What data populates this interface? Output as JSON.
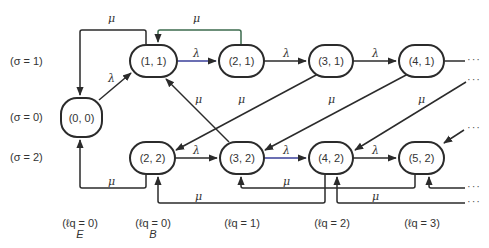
{
  "diagram": {
    "type": "state-transition",
    "row_labels": [
      {
        "id": "sigma1",
        "text": "(σ = 1)"
      },
      {
        "id": "sigma0",
        "text": "(σ = 0)"
      },
      {
        "id": "sigma2",
        "text": "(σ = 2)"
      }
    ],
    "column_labels": [
      {
        "text": "(ℓq = 0)",
        "sub": "E"
      },
      {
        "text": "(ℓq = 0)",
        "sub": "B"
      },
      {
        "text": "(ℓq = 1)",
        "sub": ""
      },
      {
        "text": "(ℓq = 2)",
        "sub": ""
      },
      {
        "text": "(ℓq = 3)",
        "sub": ""
      }
    ],
    "nodes": [
      {
        "id": "n00",
        "label": "(0, 0)"
      },
      {
        "id": "n11",
        "label": "(1, 1)"
      },
      {
        "id": "n21",
        "label": "(2, 1)"
      },
      {
        "id": "n31",
        "label": "(3, 1)"
      },
      {
        "id": "n41",
        "label": "(4, 1)"
      },
      {
        "id": "n22",
        "label": "(2, 2)"
      },
      {
        "id": "n32",
        "label": "(3, 2)"
      },
      {
        "id": "n42",
        "label": "(4, 2)"
      },
      {
        "id": "n52",
        "label": "(5, 2)"
      }
    ],
    "edges": [
      {
        "from": "(0, 0)",
        "to": "(1, 1)",
        "label": "λ"
      },
      {
        "from": "(1, 1)",
        "to": "(0, 0)",
        "label": "μ"
      },
      {
        "from": "(1, 1)",
        "to": "(2, 1)",
        "label": "λ"
      },
      {
        "from": "(2, 1)",
        "to": "(1, 1)",
        "label": "μ"
      },
      {
        "from": "(2, 1)",
        "to": "(3, 1)",
        "label": "λ"
      },
      {
        "from": "(3, 1)",
        "to": "(4, 1)",
        "label": "λ"
      },
      {
        "from": "(3, 1)",
        "to": "(2, 2)",
        "label": "μ"
      },
      {
        "from": "(4, 1)",
        "to": "(3, 2)",
        "label": "μ"
      },
      {
        "from": "…",
        "to": "(4, 2)",
        "label": "μ"
      },
      {
        "from": "(3, 2)",
        "to": "(1, 1)",
        "label": "μ"
      },
      {
        "from": "(2, 2)",
        "to": "(3, 2)",
        "label": "λ"
      },
      {
        "from": "(3, 2)",
        "to": "(4, 2)",
        "label": "λ"
      },
      {
        "from": "(4, 2)",
        "to": "(5, 2)",
        "label": "λ"
      },
      {
        "from": "(2, 2)",
        "to": "(0, 0)",
        "label": "μ"
      },
      {
        "from": "(4, 2)",
        "to": "(2, 2)",
        "label": "μ"
      },
      {
        "from": "(5, 2)",
        "to": "(3, 2)",
        "label": "μ"
      }
    ],
    "edge_labels": {
      "lambda": "λ",
      "mu": "μ"
    },
    "ellipsis": "···",
    "colors": {
      "stroke": "#2b2b2b",
      "accent_blue": "#3a3f9a",
      "accent_green": "#3d6b4e"
    }
  }
}
